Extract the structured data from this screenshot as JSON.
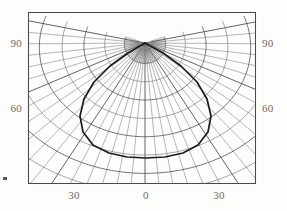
{
  "figure": {
    "kind": "polar-azimuthal-contour-plot",
    "background_color": "#fdfdfb",
    "line_color": "#4a4a48",
    "grid_color": "#6e6e6c",
    "curve_color": "#1c1c1a",
    "label_color": "#6a6a68"
  },
  "frame": {
    "left": 28,
    "top": 12,
    "right": 256,
    "bottom": 184
  },
  "pole": {
    "x": 145,
    "y": 43,
    "inner_radius": 20
  },
  "axes": {
    "bottom": {
      "ticks": [
        {
          "label": "30",
          "x": 74
        },
        {
          "label": "0",
          "x": 146
        },
        {
          "label": "30",
          "x": 219
        }
      ]
    },
    "left": {
      "ticks": [
        {
          "label": "90",
          "y": 43
        },
        {
          "label": "60",
          "y": 108
        }
      ]
    },
    "right": {
      "ticks": [
        {
          "label": "90",
          "y": 43
        },
        {
          "label": "60",
          "y": 108
        }
      ]
    }
  },
  "chart_data": {
    "type": "line",
    "title": "",
    "xlabel": "",
    "ylabel": "",
    "projection": "polar-azimuthal",
    "grid": true,
    "legend": null,
    "xlim": [
      -45,
      45
    ],
    "ylim": [
      45,
      100
    ],
    "x_tick_labels": [
      "30",
      "0",
      "30"
    ],
    "x_tick_values": [
      -30,
      0,
      30
    ],
    "y_tick_labels": [
      "90",
      "60"
    ],
    "y_tick_values": [
      90,
      60
    ],
    "series": [
      {
        "name": "contour",
        "description": "heavy closed contour lobe centred on the pole, widest near the 60 level and closing at the pole",
        "points_xy": [
          [
            145,
            43
          ],
          [
            128,
            53
          ],
          [
            110,
            66
          ],
          [
            94,
            82
          ],
          [
            84,
            99
          ],
          [
            80,
            116
          ],
          [
            83,
            132
          ],
          [
            93,
            145
          ],
          [
            109,
            153
          ],
          [
            127,
            157
          ],
          [
            146,
            158
          ],
          [
            165,
            157
          ],
          [
            183,
            153
          ],
          [
            198,
            145
          ],
          [
            208,
            132
          ],
          [
            211,
            116
          ],
          [
            207,
            99
          ],
          [
            197,
            82
          ],
          [
            181,
            66
          ],
          [
            163,
            53
          ],
          [
            145,
            43
          ]
        ]
      }
    ],
    "grid_radials_count": 37,
    "grid_arcs_levels": [
      20,
      38,
      56,
      74,
      92,
      110,
      128,
      146
    ]
  },
  "marks": {
    "left_edge_dot": {
      "x": 3,
      "y": 177,
      "w": 4,
      "h": 3
    }
  }
}
